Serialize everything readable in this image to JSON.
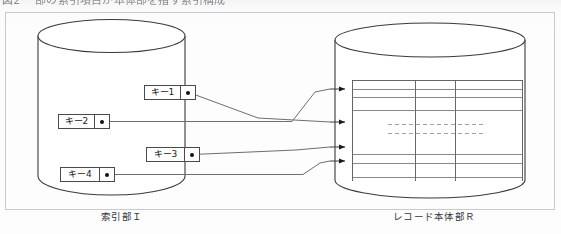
{
  "document": {
    "clipped_heading": "図2 一部の索引項目が本体部を指す索引構成",
    "background_color": "#fdfdfd",
    "frame_color": "#c9c9cf"
  },
  "diagram": {
    "type": "index-to-record-pointer-diagram",
    "line_color": "#6d6d74",
    "shape_stroke_color": "#3a3a3a",
    "index_cylinder": {
      "caption": "索引部Ｉ",
      "caption_plain": "索引部 I",
      "x": 38,
      "y": 22,
      "width": 147,
      "height": 168
    },
    "record_cylinder": {
      "caption": "レコード本体部Ｒ",
      "caption_plain": "レコード本体部R",
      "x": 335,
      "y": 25,
      "width": 190,
      "height": 170
    },
    "key_entries": [
      {
        "label": "キー1",
        "x": 144,
        "y": 85,
        "width": 52,
        "target_arrow": 1
      },
      {
        "label": "キー2",
        "x": 58,
        "y": 114,
        "width": 52,
        "target_arrow": 3
      },
      {
        "label": "キー3",
        "x": 146,
        "y": 147,
        "width": 54,
        "target_arrow": 2
      },
      {
        "label": "キー4",
        "x": 60,
        "y": 167,
        "width": 55,
        "target_arrow": 4
      }
    ],
    "record_arrows": [
      {
        "index": 1,
        "x": 337,
        "y": 89
      },
      {
        "index": 2,
        "x": 337,
        "y": 122
      },
      {
        "index": 3,
        "x": 337,
        "y": 147
      },
      {
        "index": 4,
        "x": 337,
        "y": 161
      }
    ],
    "record_table": {
      "columns": 3,
      "column_x": [
        352,
        415,
        455
      ],
      "row_lines_y": [
        87,
        96,
        110,
        154,
        163,
        177
      ],
      "ellipsis_rows_y": [
        124,
        133
      ],
      "bounds": {
        "left": 352,
        "top": 80,
        "right": 523,
        "bottom": 186
      }
    }
  }
}
